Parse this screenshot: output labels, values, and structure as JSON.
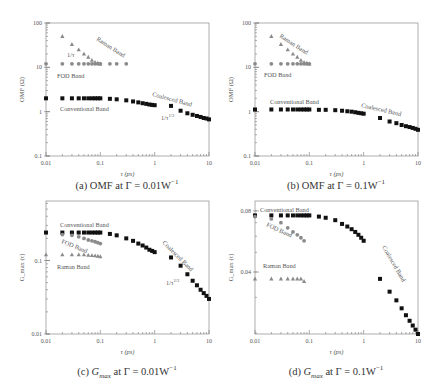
{
  "figure": {
    "panels": [
      {
        "id": "a",
        "caption_prefix": "(a)",
        "caption_quantity": "OMF",
        "caption_suffix": "at Γ = 0.01W",
        "caption_exp": "−1"
      },
      {
        "id": "b",
        "caption_prefix": "(b)",
        "caption_quantity": "OMF",
        "caption_suffix": "at Γ = 0.1W",
        "caption_exp": "−1"
      },
      {
        "id": "c",
        "caption_prefix": "(c)",
        "caption_quantity": "G",
        "caption_sub": "max",
        "caption_suffix": "at Γ = 0.01W",
        "caption_exp": "−1"
      },
      {
        "id": "d",
        "caption_prefix": "(d)",
        "caption_quantity": "G",
        "caption_sub": "max",
        "caption_suffix": "at Γ = 0.1W",
        "caption_exp": "−1"
      }
    ]
  },
  "chart_data": [
    {
      "type": "scatter",
      "title": "(a) OMF at Γ = 0.01W^-1",
      "xlabel": "τ (ps)",
      "ylabel": "OMF (Ω)",
      "xscale": "log",
      "yscale": "log",
      "xlim": [
        0.01,
        10
      ],
      "ylim": [
        0.1,
        100
      ],
      "xticks": [
        "0.01",
        "0.1",
        "1",
        "10"
      ],
      "yticks": [
        "0.1",
        "1",
        "10",
        "100"
      ],
      "frame": {
        "x0": 46,
        "x1": 209,
        "y0": 23,
        "y1": 156
      },
      "series": [
        {
          "name": "Raman Band",
          "marker": "triangle",
          "color": "#8a8a8a",
          "x": [
            0.02,
            0.03,
            0.04,
            0.05,
            0.06,
            0.07,
            0.08,
            0.09,
            0.1
          ],
          "y": [
            50,
            33,
            25,
            20,
            17,
            14.5,
            13,
            12.5,
            12
          ]
        },
        {
          "name": "FOD Band",
          "marker": "circle",
          "color": "#8a8a8a",
          "x": [
            0.01,
            0.02,
            0.03,
            0.04,
            0.05,
            0.06,
            0.07,
            0.08,
            0.09,
            0.1,
            0.15,
            0.2,
            0.3
          ],
          "y": [
            12,
            12,
            12,
            12,
            12,
            12,
            12,
            12,
            12,
            12,
            12,
            12,
            12
          ]
        },
        {
          "name": "Conventional Band",
          "marker": "square",
          "color": "#111111",
          "x": [
            0.01,
            0.02,
            0.03,
            0.04,
            0.05,
            0.06,
            0.07,
            0.08,
            0.09,
            0.1,
            0.15,
            0.2,
            0.3,
            0.4,
            0.5,
            0.6,
            0.7,
            0.8,
            0.9,
            1.0
          ],
          "y": [
            2.0,
            2.0,
            2.0,
            2.0,
            2.0,
            2.0,
            2.0,
            2.0,
            2.0,
            2.0,
            1.95,
            1.9,
            1.8,
            1.7,
            1.62,
            1.55,
            1.5,
            1.45,
            1.42,
            1.4
          ]
        },
        {
          "name": "Coalesced Band",
          "marker": "square",
          "color": "#111111",
          "x": [
            2,
            3,
            4,
            5,
            6,
            7,
            8,
            9,
            10
          ],
          "y": [
            1.35,
            1.05,
            0.92,
            0.85,
            0.8,
            0.76,
            0.72,
            0.7,
            0.67
          ]
        }
      ],
      "annotations": [
        {
          "text": "Raman Band",
          "x": 96,
          "y": 40,
          "rotate": 33,
          "color": "#555"
        },
        {
          "text": "1/τ",
          "x": 67,
          "y": 57,
          "rotate": 0,
          "color": "#555"
        },
        {
          "text": "FOD Band",
          "x": 57,
          "y": 78,
          "rotate": 0,
          "color": "#555"
        },
        {
          "text": "Conventional Band",
          "x": 60,
          "y": 111,
          "rotate": 0,
          "color": "#555"
        },
        {
          "text": "Coalesced Band",
          "x": 152,
          "y": 96,
          "rotate": 15,
          "color": "#555"
        },
        {
          "text": "1/τ^{1/3}",
          "x": 161,
          "y": 120,
          "rotate": 0,
          "color": "#555"
        }
      ]
    },
    {
      "type": "scatter",
      "title": "(b) OMF at Γ = 0.1W^-1",
      "xlabel": "τ (ps)",
      "ylabel": "OMF (Ω)",
      "xscale": "log",
      "yscale": "log",
      "xlim": [
        0.01,
        10
      ],
      "ylim": [
        0.1,
        100
      ],
      "xticks": [
        "0.01",
        "0.1",
        "1",
        "10"
      ],
      "yticks": [
        "0.1",
        "1",
        "10",
        "100"
      ],
      "frame": {
        "x0": 255,
        "x1": 418,
        "y0": 23,
        "y1": 156
      },
      "series": [
        {
          "name": "Raman Band",
          "marker": "triangle",
          "color": "#8a8a8a",
          "x": [
            0.02,
            0.03,
            0.04,
            0.05,
            0.06,
            0.07,
            0.08,
            0.09,
            0.1
          ],
          "y": [
            50,
            33,
            25,
            20,
            17,
            14.5,
            13,
            12.5,
            12
          ]
        },
        {
          "name": "FOD Band",
          "marker": "circle",
          "color": "#8a8a8a",
          "x": [
            0.01,
            0.02,
            0.03,
            0.04,
            0.05,
            0.06,
            0.07,
            0.08,
            0.09,
            0.1
          ],
          "y": [
            12,
            12,
            12,
            12,
            12,
            12,
            12,
            12,
            12,
            12
          ]
        },
        {
          "name": "Conventional Band",
          "marker": "square",
          "color": "#111111",
          "x": [
            0.01,
            0.02,
            0.03,
            0.04,
            0.05,
            0.06,
            0.07,
            0.08,
            0.09,
            0.1,
            0.15,
            0.2,
            0.3,
            0.4,
            0.5,
            0.6,
            0.7,
            0.8,
            0.9,
            1.0
          ],
          "y": [
            1.12,
            1.12,
            1.12,
            1.12,
            1.12,
            1.12,
            1.12,
            1.12,
            1.12,
            1.12,
            1.1,
            1.1,
            1.08,
            1.05,
            1.02,
            1.0,
            0.97,
            0.94,
            0.92,
            0.9
          ]
        },
        {
          "name": "Coalesced Band",
          "marker": "square",
          "color": "#111111",
          "x": [
            2,
            3,
            4,
            5,
            6,
            7,
            8,
            9,
            10
          ],
          "y": [
            0.72,
            0.6,
            0.55,
            0.5,
            0.47,
            0.45,
            0.43,
            0.41,
            0.39
          ]
        }
      ],
      "annotations": [
        {
          "text": "Raman Band",
          "x": 279,
          "y": 37,
          "rotate": 33,
          "color": "#555"
        },
        {
          "text": "FOD Band",
          "x": 264,
          "y": 77,
          "rotate": 0,
          "color": "#555"
        },
        {
          "text": "Conventional Band",
          "x": 270,
          "y": 104,
          "rotate": 0,
          "color": "#555"
        },
        {
          "text": "Coalesced Band",
          "x": 361,
          "y": 107,
          "rotate": 13,
          "color": "#555"
        }
      ]
    },
    {
      "type": "scatter",
      "title": "(c) Gmax at Γ = 0.01W^-1",
      "xlabel": "τ (ps)",
      "ylabel": "G_max (τ)",
      "xscale": "log",
      "yscale": "log",
      "xlim": [
        0.01,
        10
      ],
      "ylim": [
        0.01,
        0.645
      ],
      "xticks": [
        "0.01",
        "0.1",
        "1",
        "10"
      ],
      "yticks": [
        "0.01",
        "0.1"
      ],
      "frame": {
        "x0": 46,
        "x1": 209,
        "y0": 201,
        "y1": 334
      },
      "series": [
        {
          "name": "Conventional Band",
          "marker": "square",
          "color": "#111111",
          "x": [
            0.01,
            0.02,
            0.03,
            0.04,
            0.05,
            0.06,
            0.07,
            0.08,
            0.09,
            0.1,
            0.15,
            0.2,
            0.3,
            0.4,
            0.5,
            0.6,
            0.7,
            0.8,
            0.9,
            1.0
          ],
          "y": [
            0.24,
            0.24,
            0.24,
            0.24,
            0.24,
            0.24,
            0.24,
            0.24,
            0.24,
            0.24,
            0.23,
            0.22,
            0.2,
            0.185,
            0.17,
            0.16,
            0.15,
            0.14,
            0.135,
            0.13
          ]
        },
        {
          "name": "FOD Band",
          "marker": "circle",
          "color": "#8a8a8a",
          "x": [
            0.02,
            0.03,
            0.04,
            0.05,
            0.06,
            0.07,
            0.08,
            0.09,
            0.1
          ],
          "y": [
            0.225,
            0.22,
            0.21,
            0.2,
            0.19,
            0.185,
            0.18,
            0.175,
            0.17
          ]
        },
        {
          "name": "Raman Band",
          "marker": "triangle",
          "color": "#8a8a8a",
          "x": [
            0.01,
            0.02,
            0.03,
            0.04,
            0.05,
            0.06,
            0.07,
            0.08,
            0.09,
            0.1
          ],
          "y": [
            0.12,
            0.12,
            0.12,
            0.12,
            0.12,
            0.118,
            0.117,
            0.116,
            0.115,
            0.113
          ]
        },
        {
          "name": "Coalesced Band",
          "marker": "square",
          "color": "#111111",
          "x": [
            2,
            3,
            4,
            5,
            6,
            7,
            8,
            9,
            10
          ],
          "y": [
            0.11,
            0.085,
            0.065,
            0.053,
            0.046,
            0.04,
            0.036,
            0.033,
            0.03
          ]
        }
      ],
      "annotations": [
        {
          "text": "Conventional Band",
          "x": 60,
          "y": 227,
          "rotate": 0,
          "color": "#555"
        },
        {
          "text": "FOD Band",
          "x": 61,
          "y": 243,
          "rotate": 22,
          "color": "#555"
        },
        {
          "text": "Raman Band",
          "x": 57,
          "y": 269,
          "rotate": 0,
          "color": "#555"
        },
        {
          "text": "Coalesced Band",
          "x": 162,
          "y": 243,
          "rotate": 45,
          "color": "#555"
        },
        {
          "text": "1/τ^{2/3}",
          "x": 166,
          "y": 285,
          "rotate": 0,
          "color": "#555"
        }
      ]
    },
    {
      "type": "scatter",
      "title": "(d) Gmax at Γ = 0.1W^-1",
      "xlabel": "τ (ps)",
      "ylabel": "G_max (τ)",
      "xscale": "log",
      "yscale": "log",
      "xlim": [
        0.01,
        10
      ],
      "ylim": [
        0.0198,
        0.0895
      ],
      "xticks": [
        "0.01",
        "0.1",
        "1",
        "10"
      ],
      "yticks": [
        "0.04",
        "0.08"
      ],
      "frame": {
        "x0": 255,
        "x1": 418,
        "y0": 201,
        "y1": 334
      },
      "series": [
        {
          "name": "Conventional Band",
          "marker": "square",
          "color": "#111111",
          "x": [
            0.01,
            0.02,
            0.03,
            0.04,
            0.05,
            0.06,
            0.07,
            0.08,
            0.09,
            0.1,
            0.15,
            0.2,
            0.3,
            0.4,
            0.5,
            0.6,
            0.7,
            0.8,
            0.9,
            1.0
          ],
          "y": [
            0.076,
            0.076,
            0.076,
            0.076,
            0.076,
            0.076,
            0.076,
            0.076,
            0.076,
            0.076,
            0.075,
            0.074,
            0.072,
            0.069,
            0.067,
            0.065,
            0.063,
            0.061,
            0.059,
            0.057
          ]
        },
        {
          "name": "FOD Band",
          "marker": "circle",
          "color": "#8a8a8a",
          "x": [
            0.01,
            0.02,
            0.03,
            0.04,
            0.05,
            0.06,
            0.07,
            0.08
          ],
          "y": [
            0.075,
            0.073,
            0.07,
            0.066,
            0.063,
            0.061,
            0.059,
            0.057
          ]
        },
        {
          "name": "Raman Band",
          "marker": "triangle",
          "color": "#8a8a8a",
          "x": [
            0.01,
            0.02,
            0.03,
            0.04,
            0.05,
            0.06,
            0.07,
            0.08
          ],
          "y": [
            0.037,
            0.037,
            0.037,
            0.037,
            0.037,
            0.037,
            0.037,
            0.036
          ]
        },
        {
          "name": "Coalesced Band",
          "marker": "square",
          "color": "#111111",
          "x": [
            2,
            3,
            4,
            5,
            6,
            7,
            8,
            9,
            10
          ],
          "y": [
            0.037,
            0.032,
            0.029,
            0.0265,
            0.0245,
            0.023,
            0.0218,
            0.0208,
            0.0198
          ]
        }
      ],
      "annotations": [
        {
          "text": "Conventional Band",
          "x": 260,
          "y": 212,
          "rotate": 0,
          "color": "#555"
        },
        {
          "text": "FOD Band",
          "x": 266,
          "y": 226,
          "rotate": 25,
          "color": "#555"
        },
        {
          "text": "Raman Band",
          "x": 263,
          "y": 268,
          "rotate": 0,
          "color": "#555"
        },
        {
          "text": "Coalesced Band",
          "x": 382,
          "y": 247,
          "rotate": 60,
          "color": "#555"
        }
      ]
    }
  ]
}
